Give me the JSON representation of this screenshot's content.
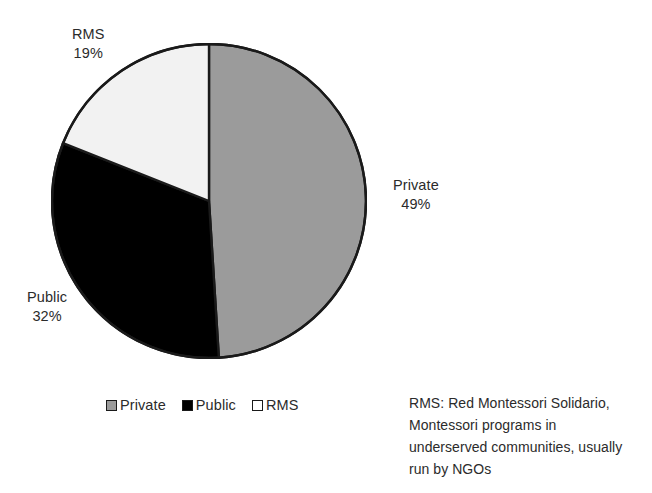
{
  "chart_data": {
    "type": "pie",
    "title": "",
    "categories": [
      "Private",
      "Public",
      "RMS"
    ],
    "values": [
      49,
      32,
      19
    ],
    "value_unit": "percent",
    "start_angle_deg": 0,
    "direction": "clockwise",
    "legend_position": "bottom-left",
    "colors": {
      "private": "#9b9b9b",
      "public": "#000000",
      "rms": "#f2f2f2",
      "outline": "#1a1a1a",
      "text": "#2b2b2b"
    },
    "slices": [
      {
        "key": "private",
        "label": "Private",
        "value": 49,
        "value_text": "49%",
        "color": "#9b9b9b"
      },
      {
        "key": "public",
        "label": "Public",
        "value": 32,
        "value_text": "32%",
        "color": "#000000"
      },
      {
        "key": "rms",
        "label": "RMS",
        "value": 19,
        "value_text": "19%",
        "color": "#f2f2f2"
      }
    ],
    "annotations": [
      "RMS: Red Montessori Solidario, Montessori programs in underserved communities, usually run by NGOs"
    ]
  },
  "slice_labels": {
    "rms": {
      "name": "RMS",
      "pct": "19%"
    },
    "private": {
      "name": "Private",
      "pct": "49%"
    },
    "public": {
      "name": "Public",
      "pct": "32%"
    }
  },
  "legend": {
    "items": [
      {
        "label": "Private",
        "swatch": "legend-swatch-gray"
      },
      {
        "label": "Public",
        "swatch": "legend-swatch-black"
      },
      {
        "label": "RMS",
        "swatch": "legend-swatch-white"
      }
    ]
  },
  "caption": {
    "lines": [
      "RMS: Red Montessori Solidario,",
      "Montessori programs in",
      "underserved communities, usually",
      "run by NGOs"
    ]
  }
}
